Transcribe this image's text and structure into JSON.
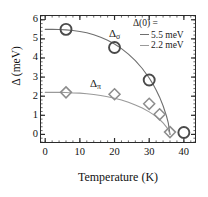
{
  "axes": {
    "x_title": "Temperature (K)",
    "y_title": "Δ (meV)",
    "x_ticks": [
      "0",
      "10",
      "20",
      "30",
      "40"
    ],
    "y_ticks": [
      "0",
      "1",
      "2",
      "3",
      "4",
      "5",
      "6"
    ]
  },
  "annotations": {
    "sigma_label": "Δ",
    "sigma_sub": "σ",
    "pi_label": "Δ",
    "pi_sub": "π"
  },
  "legend": {
    "title": "Δ(0) =",
    "entries": [
      {
        "label": "5.5 meV",
        "color": "#6f6f6f"
      },
      {
        "label": "2.2 meV",
        "color": "#9a9a9a"
      }
    ]
  },
  "chart_data": {
    "type": "scatter",
    "title": "",
    "xlabel": "Temperature (K)",
    "ylabel": "Δ (meV)",
    "xlim": [
      -1.5,
      43.5
    ],
    "ylim": [
      -0.45,
      6.25
    ],
    "xticks": [
      0,
      10,
      20,
      30,
      40
    ],
    "yticks": [
      0,
      1,
      2,
      3,
      4,
      5,
      6
    ],
    "x_minor_tick_step": 2,
    "y_minor_tick_step": 0.2,
    "grid": false,
    "legend_position": "top-right",
    "series": [
      {
        "name": "Δσ",
        "marker": "circle",
        "marker_color": "#4a4a4a",
        "marker_size": 11,
        "x": [
          6,
          20,
          30,
          40
        ],
        "y": [
          5.5,
          4.55,
          2.85,
          0.1
        ]
      },
      {
        "name": "Δπ",
        "marker": "diamond",
        "marker_color": "#8d8d8d",
        "marker_size": 11,
        "x": [
          6,
          20,
          30,
          33,
          36
        ],
        "y": [
          2.2,
          2.1,
          1.6,
          1.05,
          0.12
        ]
      }
    ],
    "fits": [
      {
        "name": "BCS fit Δ(0) = 5.5 meV",
        "delta0": 5.5,
        "tc": 36,
        "color": "#6f6f6f",
        "x": [
          0,
          2,
          4,
          6,
          8,
          10,
          12,
          14,
          16,
          18,
          20,
          22,
          24,
          26,
          28,
          30,
          31,
          32,
          33,
          34,
          35,
          35.5,
          36
        ],
        "y": [
          5.5,
          5.5,
          5.49,
          5.47,
          5.44,
          5.39,
          5.32,
          5.22,
          5.09,
          4.93,
          4.73,
          4.49,
          4.2,
          3.86,
          3.45,
          2.95,
          2.66,
          2.33,
          1.95,
          1.5,
          0.95,
          0.6,
          0.0
        ]
      },
      {
        "name": "BCS fit Δ(0) = 2.2 meV",
        "delta0": 2.2,
        "tc": 36,
        "color": "#9a9a9a",
        "x": [
          0,
          2,
          4,
          6,
          8,
          10,
          12,
          14,
          16,
          18,
          20,
          22,
          24,
          26,
          28,
          30,
          31,
          32,
          33,
          34,
          35,
          35.5,
          36
        ],
        "y": [
          2.2,
          2.2,
          2.2,
          2.19,
          2.17,
          2.16,
          2.13,
          2.09,
          2.04,
          1.97,
          1.89,
          1.8,
          1.68,
          1.54,
          1.38,
          1.18,
          1.06,
          0.93,
          0.78,
          0.6,
          0.38,
          0.24,
          0.0
        ]
      }
    ]
  }
}
